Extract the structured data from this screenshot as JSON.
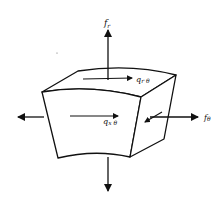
{
  "diagram": {
    "type": "free-body diagram of curved shell element",
    "labels": {
      "fr": {
        "main": "f",
        "sub": "r"
      },
      "ftheta": {
        "main": "f",
        "sub": "θ"
      },
      "qrtheta": {
        "main": "q",
        "sub": "r θ"
      },
      "qxtheta": {
        "main": "q",
        "sub": "x θ"
      }
    },
    "arrows": [
      {
        "name": "radial-force-up",
        "direction": "up",
        "label": "f_r"
      },
      {
        "name": "circumferential-force-right",
        "direction": "right",
        "label": "f_θ"
      },
      {
        "name": "force-left",
        "direction": "left"
      },
      {
        "name": "force-down",
        "direction": "down"
      },
      {
        "name": "shear-top-face",
        "direction": "right",
        "label": "q_rθ"
      },
      {
        "name": "shear-front-face",
        "direction": "right",
        "label": "q_xθ"
      }
    ],
    "colors": {
      "stroke": "#111111",
      "background": "#ffffff"
    }
  }
}
